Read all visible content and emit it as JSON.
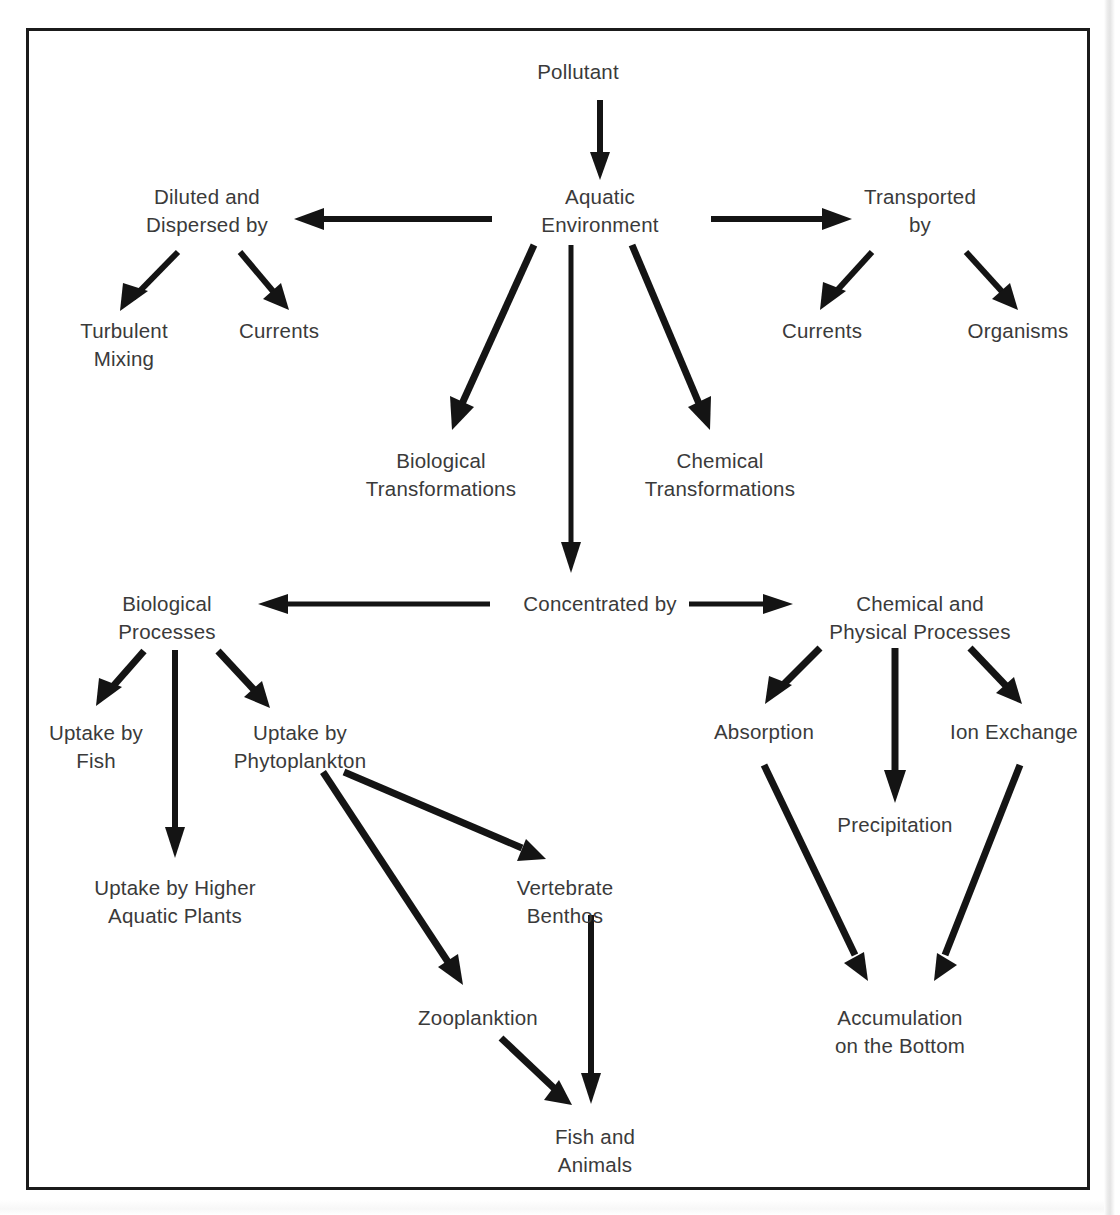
{
  "diagram": {
    "type": "flowchart",
    "line_color": "#141414",
    "text_color": "#3a3a3a",
    "border_color": "#1b1b1b",
    "background": "#ffffff",
    "nodes": {
      "pollutant": {
        "label": "Pollutant",
        "x": 578,
        "y": 72
      },
      "aquatic_environment": {
        "line1": "Aquatic",
        "line2": "Environment",
        "x": 600,
        "y": 204
      },
      "diluted_dispersed": {
        "line1": "Diluted and",
        "line2": "Dispersed by",
        "x": 207,
        "y": 204
      },
      "transported_by": {
        "line1": "Transported",
        "line2": "by",
        "x": 920,
        "y": 204
      },
      "turbulent_mixing": {
        "line1": "Turbulent",
        "line2": "Mixing",
        "x": 124,
        "y": 331
      },
      "currents_left": {
        "label": "Currents",
        "x": 279,
        "y": 331
      },
      "currents_right": {
        "label": "Currents",
        "x": 822,
        "y": 331
      },
      "organisms": {
        "label": "Organisms",
        "x": 1018,
        "y": 331
      },
      "biological_transformations": {
        "line1": "Biological",
        "line2": "Transformations",
        "x": 441,
        "y": 464
      },
      "chemical_transformations": {
        "line1": "Chemical",
        "line2": "Transformations",
        "x": 720,
        "y": 464
      },
      "concentrated_by": {
        "label": "Concentrated by",
        "x": 600,
        "y": 604
      },
      "biological_processes": {
        "line1": "Biological",
        "line2": "Processes",
        "x": 167,
        "y": 604
      },
      "chemical_physical_processes": {
        "line1": "Chemical and",
        "line2": "Physical Processes",
        "x": 920,
        "y": 604
      },
      "uptake_by_fish": {
        "line1": "Uptake by",
        "line2": "Fish",
        "x": 94,
        "y": 736
      },
      "uptake_by_phytoplankton": {
        "line1": "Uptake by",
        "line2": "Phytoplankton",
        "x": 300,
        "y": 736
      },
      "absorption": {
        "label": "Absorption",
        "x": 764,
        "y": 732
      },
      "ion_exchange": {
        "label": "Ion Exchange",
        "x": 1014,
        "y": 732
      },
      "precipitation": {
        "label": "Precipitation",
        "x": 895,
        "y": 825
      },
      "uptake_higher_plants": {
        "line1": "Uptake by Higher",
        "line2": "Aquatic Plants",
        "x": 175,
        "y": 891
      },
      "vertebrate_benthos": {
        "line1": "Vertebrate",
        "line2": "Benthos",
        "x": 565,
        "y": 891
      },
      "zooplanktion": {
        "label": "Zooplanktion",
        "x": 478,
        "y": 1018
      },
      "accumulation_bottom": {
        "line1": "Accumulation",
        "line2": "on the Bottom",
        "x": 900,
        "y": 1018
      },
      "fish_and_animals": {
        "line1": "Fish and",
        "line2": "Animals",
        "x": 595,
        "y": 1140
      }
    },
    "edges": [
      {
        "name": "pollutant-to-aquatic-environment",
        "from": "pollutant",
        "to": "aquatic_environment"
      },
      {
        "name": "aquatic-environment-to-diluted-dispersed",
        "from": "aquatic_environment",
        "to": "diluted_dispersed"
      },
      {
        "name": "aquatic-environment-to-transported-by",
        "from": "aquatic_environment",
        "to": "transported_by"
      },
      {
        "name": "diluted-dispersed-to-turbulent-mixing",
        "from": "diluted_dispersed",
        "to": "turbulent_mixing"
      },
      {
        "name": "diluted-dispersed-to-currents-left",
        "from": "diluted_dispersed",
        "to": "currents_left"
      },
      {
        "name": "transported-by-to-currents-right",
        "from": "transported_by",
        "to": "currents_right"
      },
      {
        "name": "transported-by-to-organisms",
        "from": "transported_by",
        "to": "organisms"
      },
      {
        "name": "aquatic-environment-to-biological-transformations",
        "from": "aquatic_environment",
        "to": "biological_transformations"
      },
      {
        "name": "aquatic-environment-to-chemical-transformations",
        "from": "aquatic_environment",
        "to": "chemical_transformations"
      },
      {
        "name": "aquatic-environment-to-concentrated-by",
        "from": "aquatic_environment",
        "to": "concentrated_by"
      },
      {
        "name": "concentrated-by-to-biological-processes",
        "from": "concentrated_by",
        "to": "biological_processes"
      },
      {
        "name": "concentrated-by-to-chemical-physical-processes",
        "from": "concentrated_by",
        "to": "chemical_physical_processes"
      },
      {
        "name": "biological-processes-to-uptake-by-fish",
        "from": "biological_processes",
        "to": "uptake_by_fish"
      },
      {
        "name": "biological-processes-to-uptake-higher-plants",
        "from": "biological_processes",
        "to": "uptake_higher_plants"
      },
      {
        "name": "biological-processes-to-uptake-by-phytoplankton",
        "from": "biological_processes",
        "to": "uptake_by_phytoplankton"
      },
      {
        "name": "uptake-by-phytoplankton-to-vertebrate-benthos",
        "from": "uptake_by_phytoplankton",
        "to": "vertebrate_benthos"
      },
      {
        "name": "uptake-by-phytoplankton-to-zooplanktion",
        "from": "uptake_by_phytoplankton",
        "to": "zooplanktion"
      },
      {
        "name": "zooplanktion-to-fish-and-animals",
        "from": "zooplanktion",
        "to": "fish_and_animals"
      },
      {
        "name": "vertebrate-benthos-to-fish-and-animals",
        "from": "vertebrate_benthos",
        "to": "fish_and_animals"
      },
      {
        "name": "chemical-physical-processes-to-absorption",
        "from": "chemical_physical_processes",
        "to": "absorption"
      },
      {
        "name": "chemical-physical-processes-to-precipitation",
        "from": "chemical_physical_processes",
        "to": "precipitation"
      },
      {
        "name": "chemical-physical-processes-to-ion-exchange",
        "from": "chemical_physical_processes",
        "to": "ion_exchange"
      },
      {
        "name": "absorption-to-accumulation-bottom",
        "from": "absorption",
        "to": "accumulation_bottom"
      },
      {
        "name": "ion-exchange-to-accumulation-bottom",
        "from": "ion_exchange",
        "to": "accumulation_bottom"
      }
    ]
  }
}
